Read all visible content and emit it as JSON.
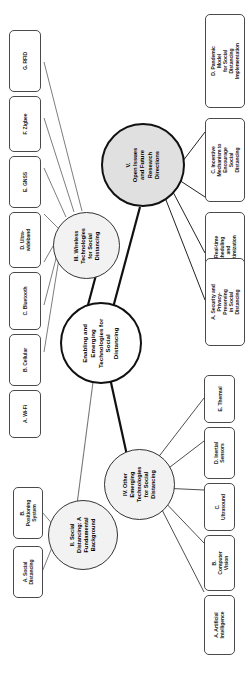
{
  "diagram": {
    "title": "Enabling and Emerging Technologies for Social Distancing",
    "type": "mind-map",
    "orientation": "rotated-90-clockwise",
    "colors": {
      "root_fill": "#ffffff",
      "section_fill": "#e0e0e0",
      "subsection_fill": "#f2f2f2",
      "leaf_fill": "#ffffff",
      "stroke": "#111111",
      "text": "#000000"
    },
    "root": {
      "label": "Enabling and\nEmerging\nTechnologies for\nSocial\nDistancing"
    },
    "sections": [
      {
        "id": "section-v",
        "label": "V.\nOpen Issues\nand Future\nResearch\nDirections",
        "children": [
          {
            "id": "leaf-v-a",
            "label": "A. Security and\nPrivacy-Preserving\nin Social Distancing"
          },
          {
            "id": "leaf-v-b",
            "label": "B. Real-time\nScheduling\nand Optimization"
          },
          {
            "id": "leaf-v-c",
            "label": "C. Incentive\nMechanism to\nEncourage Social\nDistancing"
          },
          {
            "id": "leaf-v-d",
            "label": "D. Pandemic Model\nfor Social\nDistancing\nImplementation"
          }
        ]
      },
      {
        "id": "section-iii",
        "label": "III. Wireless\nTechnologies\nfor Social\nDistancing",
        "children": [
          {
            "id": "leaf-iii-a",
            "label": "A. Wi-Fi"
          },
          {
            "id": "leaf-iii-b",
            "label": "B. Cellular"
          },
          {
            "id": "leaf-iii-c",
            "label": "C. Bluetooth"
          },
          {
            "id": "leaf-iii-d",
            "label": "D. Ultra-\nwideband"
          },
          {
            "id": "leaf-iii-e",
            "label": "E. GNSS"
          },
          {
            "id": "leaf-iii-f",
            "label": "F. Zigbee"
          },
          {
            "id": "leaf-iii-g",
            "label": "G. RFID"
          }
        ]
      },
      {
        "id": "section-ii",
        "label": "II. Social\nDistancing: A\nFundamental\nBackground",
        "children": [
          {
            "id": "leaf-ii-a",
            "label": "A. Social\nDistancing"
          },
          {
            "id": "leaf-ii-b",
            "label": "B.\nPositioning\nSystem"
          }
        ]
      },
      {
        "id": "section-iv",
        "label": "IV. Other\nEmerging\nTechnologies\nfor Social\nDistancing",
        "children": [
          {
            "id": "leaf-iv-a",
            "label": "A. Artificial\nIntelligence"
          },
          {
            "id": "leaf-iv-b",
            "label": "B. Computer\nVision"
          },
          {
            "id": "leaf-iv-c",
            "label": "C.\nUltrasound"
          },
          {
            "id": "leaf-iv-d",
            "label": "D. Inertial\nSensors"
          },
          {
            "id": "leaf-iv-e",
            "label": "E. Thermal"
          }
        ]
      }
    ]
  }
}
